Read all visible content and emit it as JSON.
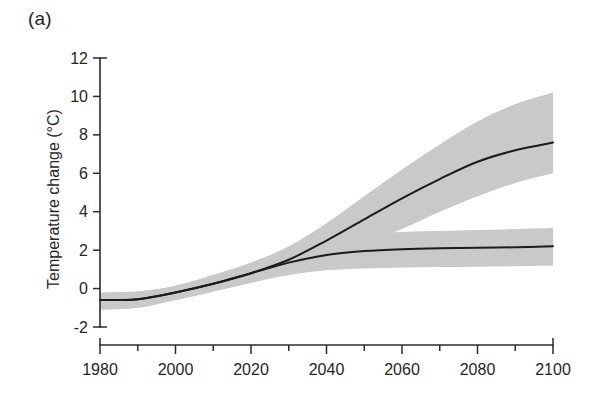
{
  "figure": {
    "panel_label": "(a)",
    "background_color": "#ffffff",
    "line_color": "#1c1c1c",
    "band_color": "#c9c9c9"
  },
  "chart_data": {
    "type": "line",
    "title": "",
    "subtitle": "",
    "panel": "(a)",
    "xlabel": "",
    "ylabel": "Temperature change (°C)",
    "xlim": [
      1980,
      2100
    ],
    "ylim": [
      -2,
      12
    ],
    "xticks": [
      1980,
      2000,
      2020,
      2040,
      2060,
      2080,
      2100
    ],
    "xtick_labels": [
      "1980",
      "2000",
      "2020",
      "2040",
      "2060",
      "2080",
      "2100"
    ],
    "xminor_ticks": [
      1990,
      2010,
      2030,
      2050,
      2070,
      2090
    ],
    "yticks": [
      -2,
      0,
      2,
      4,
      6,
      8,
      10,
      12
    ],
    "ytick_labels": [
      "-2",
      "0",
      "2",
      "4",
      "6",
      "8",
      "10",
      "12"
    ],
    "grid": false,
    "legend": false,
    "legend_position": "none",
    "x": [
      1980,
      1990,
      2000,
      2010,
      2020,
      2030,
      2040,
      2050,
      2060,
      2070,
      2080,
      2090,
      2100
    ],
    "series": [
      {
        "name": "High scenario",
        "style": "line-with-uncertainty-band",
        "values": [
          -0.6,
          -0.55,
          -0.2,
          0.25,
          0.8,
          1.5,
          2.5,
          3.6,
          4.7,
          5.7,
          6.6,
          7.2,
          7.6
        ],
        "band_low": [
          -1.1,
          -1.0,
          -0.6,
          -0.15,
          0.3,
          0.85,
          1.5,
          2.3,
          3.1,
          4.0,
          4.8,
          5.5,
          6.0
        ],
        "band_high": [
          -0.2,
          -0.15,
          0.15,
          0.7,
          1.35,
          2.2,
          3.4,
          4.8,
          6.2,
          7.5,
          8.7,
          9.6,
          10.2
        ]
      },
      {
        "name": "Stabilisation scenario",
        "style": "line-with-uncertainty-band",
        "values": [
          -0.6,
          -0.55,
          -0.2,
          0.25,
          0.8,
          1.35,
          1.75,
          1.95,
          2.05,
          2.1,
          2.12,
          2.15,
          2.2
        ],
        "band_low": [
          -1.1,
          -1.0,
          -0.6,
          -0.15,
          0.3,
          0.7,
          0.95,
          1.05,
          1.1,
          1.12,
          1.14,
          1.16,
          1.2
        ],
        "band_high": [
          -0.2,
          -0.15,
          0.15,
          0.7,
          1.35,
          2.0,
          2.5,
          2.8,
          2.95,
          3.0,
          3.05,
          3.1,
          3.15
        ]
      }
    ],
    "annotations": []
  }
}
